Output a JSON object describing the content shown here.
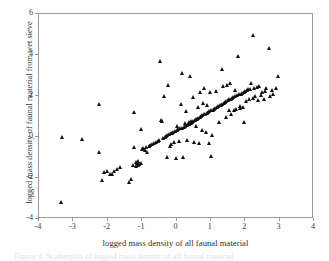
{
  "figure": {
    "background_color": "#ffffff",
    "axis_color": "#9a9a9a",
    "marker_color": "#0d0d0d",
    "caption_partial": "Figure 4. Scatterplot of logged mass density of all faunal material"
  },
  "chart_data": {
    "type": "scatter",
    "title": "",
    "xlabel": "logged mass density of all faunal material",
    "ylabel": "logged mass density of faunal material from wet sieve",
    "xlim": [
      -4,
      4
    ],
    "ylim": [
      -4,
      6
    ],
    "xticks": [
      -4,
      -3,
      -2,
      -1,
      0,
      1,
      2,
      3,
      4
    ],
    "yticks": [
      -4,
      -2,
      0,
      2,
      4,
      6
    ],
    "xticklabels": [
      "-4",
      "-3",
      "-2",
      "-1",
      "0",
      "1",
      "2",
      "3",
      "4"
    ],
    "yticklabels": [
      "-4",
      "-2",
      "0",
      "2",
      "4",
      "6"
    ],
    "grid": false,
    "legend": null,
    "marker": "triangle-up",
    "n_points": 172,
    "points": [
      [
        -3.3,
        -3.27
      ],
      [
        -3.28,
        -0.1
      ],
      [
        -2.7,
        -0.17
      ],
      [
        -2.22,
        1.53
      ],
      [
        -2.2,
        -0.8
      ],
      [
        -2.13,
        -2.18
      ],
      [
        -2.05,
        -1.77
      ],
      [
        -1.97,
        -1.73
      ],
      [
        -1.9,
        -1.9
      ],
      [
        -1.83,
        -1.86
      ],
      [
        -1.76,
        -1.72
      ],
      [
        -1.68,
        -1.63
      ],
      [
        -1.6,
        -1.56
      ],
      [
        -1.35,
        -2.28
      ],
      [
        -1.28,
        -2.14
      ],
      [
        -1.22,
        -1.43
      ],
      [
        -1.2,
        1.12
      ],
      [
        -1.18,
        -0.56
      ],
      [
        -1.14,
        -1.3
      ],
      [
        -1.12,
        -1.5
      ],
      [
        -1.1,
        -1.36
      ],
      [
        -1.08,
        -1.25
      ],
      [
        -1.06,
        -1.44
      ],
      [
        -1.04,
        -1.38
      ],
      [
        -1.0,
        0.32
      ],
      [
        -0.98,
        -1.33
      ],
      [
        -0.95,
        -0.68
      ],
      [
        -0.92,
        -0.62
      ],
      [
        -0.88,
        -0.72
      ],
      [
        -0.85,
        -0.58
      ],
      [
        -0.8,
        -0.8
      ],
      [
        -0.76,
        -0.52
      ],
      [
        -0.72,
        -0.48
      ],
      [
        -0.68,
        -0.44
      ],
      [
        -0.62,
        -0.38
      ],
      [
        -0.56,
        -0.3
      ],
      [
        -0.5,
        -0.25
      ],
      [
        -0.46,
        -0.2
      ],
      [
        -0.42,
        3.65
      ],
      [
        -0.4,
        0.76
      ],
      [
        -0.38,
        0.72
      ],
      [
        -0.36,
        -0.15
      ],
      [
        -0.33,
        1.92
      ],
      [
        -0.3,
        -0.1
      ],
      [
        -0.27,
        -0.05
      ],
      [
        -0.24,
        0.0
      ],
      [
        -0.22,
        -1.06
      ],
      [
        -0.2,
        2.44
      ],
      [
        -0.18,
        0.05
      ],
      [
        -0.15,
        -0.5
      ],
      [
        -0.12,
        0.1
      ],
      [
        -0.1,
        -0.42
      ],
      [
        -0.08,
        0.14
      ],
      [
        -0.05,
        0.18
      ],
      [
        -0.03,
        -0.3
      ],
      [
        0.0,
        0.22
      ],
      [
        0.02,
        -1.12
      ],
      [
        0.05,
        0.26
      ],
      [
        0.07,
        0.44
      ],
      [
        0.1,
        0.3
      ],
      [
        0.12,
        -0.25
      ],
      [
        0.15,
        0.34
      ],
      [
        0.17,
        1.55
      ],
      [
        0.2,
        0.38
      ],
      [
        0.22,
        3.02
      ],
      [
        0.24,
        -1.05
      ],
      [
        0.26,
        0.42
      ],
      [
        0.28,
        0.6
      ],
      [
        0.3,
        0.46
      ],
      [
        0.32,
        1.18
      ],
      [
        0.34,
        0.5
      ],
      [
        0.36,
        -0.2
      ],
      [
        0.38,
        0.54
      ],
      [
        0.4,
        0.66
      ],
      [
        0.42,
        0.58
      ],
      [
        0.44,
        2.92
      ],
      [
        0.46,
        0.62
      ],
      [
        0.48,
        0.72
      ],
      [
        0.5,
        0.66
      ],
      [
        0.52,
        1.86
      ],
      [
        0.54,
        0.7
      ],
      [
        0.56,
        -0.3
      ],
      [
        0.58,
        0.74
      ],
      [
        0.6,
        0.78
      ],
      [
        0.62,
        0.45
      ],
      [
        0.64,
        0.82
      ],
      [
        0.66,
        1.38
      ],
      [
        0.68,
        0.86
      ],
      [
        0.7,
        -0.36
      ],
      [
        0.72,
        0.9
      ],
      [
        0.74,
        2.12
      ],
      [
        0.76,
        0.94
      ],
      [
        0.78,
        0.26
      ],
      [
        0.8,
        0.98
      ],
      [
        0.82,
        1.6
      ],
      [
        0.84,
        1.02
      ],
      [
        0.86,
        2.3
      ],
      [
        0.88,
        1.06
      ],
      [
        0.9,
        0.18
      ],
      [
        0.92,
        1.1
      ],
      [
        0.94,
        1.48
      ],
      [
        0.96,
        1.14
      ],
      [
        0.98,
        -0.35
      ],
      [
        1.0,
        1.18
      ],
      [
        1.02,
        2.1
      ],
      [
        1.04,
        -1.02
      ],
      [
        1.06,
        1.22
      ],
      [
        1.08,
        0.02
      ],
      [
        1.1,
        1.26
      ],
      [
        1.14,
        1.3
      ],
      [
        1.18,
        1.34
      ],
      [
        1.2,
        2.18
      ],
      [
        1.22,
        1.38
      ],
      [
        1.26,
        1.42
      ],
      [
        1.28,
        0.64
      ],
      [
        1.3,
        1.46
      ],
      [
        1.34,
        1.5
      ],
      [
        1.36,
        3.22
      ],
      [
        1.38,
        1.54
      ],
      [
        1.4,
        2.4
      ],
      [
        1.42,
        1.58
      ],
      [
        1.46,
        1.62
      ],
      [
        1.48,
        0.9
      ],
      [
        1.5,
        1.68
      ],
      [
        1.52,
        2.48
      ],
      [
        1.54,
        1.72
      ],
      [
        1.56,
        1.22
      ],
      [
        1.58,
        1.76
      ],
      [
        1.6,
        2.56
      ],
      [
        1.62,
        1.8
      ],
      [
        1.64,
        1.06
      ],
      [
        1.66,
        1.84
      ],
      [
        1.7,
        1.88
      ],
      [
        1.72,
        1.25
      ],
      [
        1.74,
        1.92
      ],
      [
        1.76,
        2.2
      ],
      [
        1.78,
        1.3
      ],
      [
        1.8,
        1.96
      ],
      [
        1.84,
        3.87
      ],
      [
        1.86,
        2.0
      ],
      [
        1.88,
        1.34
      ],
      [
        1.9,
        1.45
      ],
      [
        1.92,
        2.04
      ],
      [
        1.96,
        2.08
      ],
      [
        1.98,
        1.4
      ],
      [
        2.0,
        2.12
      ],
      [
        2.02,
        0.66
      ],
      [
        2.05,
        2.16
      ],
      [
        2.08,
        1.7
      ],
      [
        2.1,
        2.2
      ],
      [
        2.14,
        2.24
      ],
      [
        2.16,
        1.78
      ],
      [
        2.18,
        2.28
      ],
      [
        2.22,
        2.55
      ],
      [
        2.26,
        1.84
      ],
      [
        2.28,
        4.9
      ],
      [
        2.3,
        2.32
      ],
      [
        2.34,
        1.9
      ],
      [
        2.38,
        2.36
      ],
      [
        2.42,
        1.74
      ],
      [
        2.46,
        2.4
      ],
      [
        2.5,
        1.96
      ],
      [
        2.54,
        2.12
      ],
      [
        2.58,
        1.8
      ],
      [
        2.62,
        2.16
      ],
      [
        2.66,
        2.3
      ],
      [
        2.74,
        4.25
      ],
      [
        2.78,
        1.92
      ],
      [
        2.82,
        2.22
      ],
      [
        2.86,
        2.02
      ],
      [
        2.94,
        2.3
      ],
      [
        3.0,
        2.88
      ]
    ]
  }
}
